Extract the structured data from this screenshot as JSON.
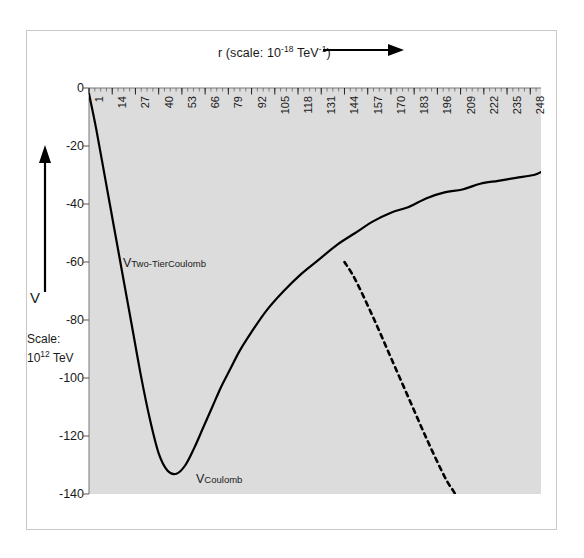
{
  "figure": {
    "title_prefix": "r (scale: 10",
    "title_exp": "-18",
    "title_mid": " TeV",
    "title_exp2": "-1",
    "title_suffix": ")",
    "title_plain": "r (scale: 10^-18 TeV^-1)",
    "arrow_icon": "right-arrow-icon",
    "background_color": "#ffffff",
    "panel_color": "#dcdcdc",
    "curve_color": "#000000",
    "frame_color": "#c8c8c8"
  },
  "yaxis": {
    "label": "V",
    "scale_line1": "Scale:",
    "scale_base": "10",
    "scale_exp": "12",
    "scale_unit": " TeV",
    "arrow_icon": "up-arrow-icon",
    "ticks": [
      {
        "label": "0",
        "value": 0
      },
      {
        "label": "-20",
        "value": -20
      },
      {
        "label": "-40",
        "value": -40
      },
      {
        "label": "-60",
        "value": -60
      },
      {
        "label": "-80",
        "value": -80
      },
      {
        "label": "-100",
        "value": -100
      },
      {
        "label": "-120",
        "value": -120
      },
      {
        "label": "-140",
        "value": -140
      }
    ]
  },
  "xaxis": {
    "ticks": [
      {
        "label": "1",
        "value": 1
      },
      {
        "label": "14",
        "value": 14
      },
      {
        "label": "27",
        "value": 27
      },
      {
        "label": "40",
        "value": 40
      },
      {
        "label": "53",
        "value": 53
      },
      {
        "label": "66",
        "value": 66
      },
      {
        "label": "79",
        "value": 79
      },
      {
        "label": "92",
        "value": 92
      },
      {
        "label": "105",
        "value": 105
      },
      {
        "label": "118",
        "value": 118
      },
      {
        "label": "131",
        "value": 131
      },
      {
        "label": "144",
        "value": 144
      },
      {
        "label": "157",
        "value": 157
      },
      {
        "label": "170",
        "value": 170
      },
      {
        "label": "183",
        "value": 183
      },
      {
        "label": "196",
        "value": 196
      },
      {
        "label": "209",
        "value": 209
      },
      {
        "label": "222",
        "value": 222
      },
      {
        "label": "235",
        "value": 235
      },
      {
        "label": "248",
        "value": 248
      }
    ]
  },
  "series_labels": {
    "two_tier_base": "V",
    "two_tier_sub": "Two-TierCoulomb",
    "coulomb_base": "V",
    "coulomb_sub": "Coulomb"
  },
  "chart_data": {
    "type": "line",
    "xlabel": "r (scale: 10^-18 TeV^-1)",
    "ylabel": "V (Scale: 10^12 TeV)",
    "xlim": [
      1,
      254
    ],
    "ylim": [
      -140,
      0
    ],
    "grid": false,
    "legend": "inline-annotations",
    "axis_notes": {
      "x_axis_position": "top",
      "x_tick_rotation": -90,
      "y_direction": "increasing-upward",
      "minor_ticks_x": true
    },
    "series": [
      {
        "name": "V_Two-TierCoulomb",
        "style": "solid",
        "x": [
          1,
          5,
          10,
          15,
          20,
          25,
          30,
          35,
          40,
          45,
          50,
          55,
          60,
          65,
          70,
          75,
          80,
          85,
          90,
          100,
          110,
          120,
          130,
          140,
          150,
          160,
          170,
          180,
          190,
          200,
          210,
          220,
          230,
          240,
          250,
          254
        ],
        "y": [
          -2,
          -14,
          -31,
          -48,
          -65,
          -82,
          -99,
          -114,
          -126,
          -132,
          -133,
          -130,
          -124,
          -117,
          -110,
          -103,
          -97,
          -91,
          -86,
          -77,
          -70,
          -64,
          -59,
          -54,
          -50,
          -46,
          -43,
          -41,
          -38,
          -36,
          -35,
          -33,
          -32,
          -31,
          -30,
          -29
        ]
      },
      {
        "name": "V_Coulomb",
        "style": "dashed",
        "x": [
          144,
          150,
          160,
          170,
          180,
          190,
          200,
          205,
          210
        ],
        "y": [
          -60,
          -66,
          -79,
          -93,
          -107,
          -121,
          -134,
          -139,
          -144
        ]
      }
    ],
    "annotations": [
      {
        "text": "V_Two-TierCoulomb",
        "x": 26,
        "y": -55
      },
      {
        "text": "V_Coulomb",
        "x": 78,
        "y": -131
      }
    ]
  }
}
